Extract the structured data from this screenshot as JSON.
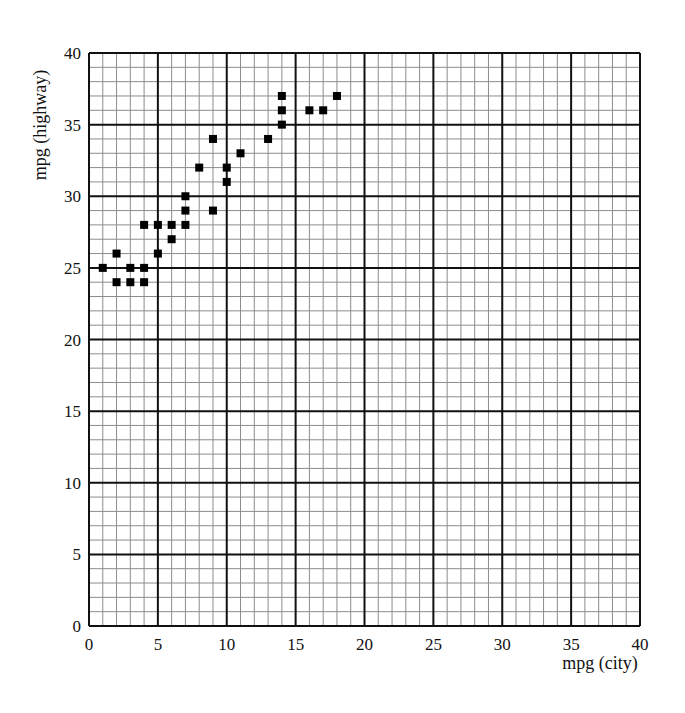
{
  "chart_data": {
    "type": "scatter",
    "title": "",
    "xlabel": "mpg (city)",
    "ylabel": "mpg (highway)",
    "xlim": [
      0,
      40
    ],
    "ylim": [
      0,
      40
    ],
    "xticks": [
      0,
      5,
      10,
      15,
      20,
      25,
      30,
      35,
      40
    ],
    "yticks": [
      0,
      5,
      10,
      15,
      20,
      25,
      30,
      35,
      40
    ],
    "grid": {
      "minor_step": 1,
      "major_step": 5,
      "on": true
    },
    "legend": null,
    "marker": "square",
    "points": [
      {
        "x": 1,
        "y": 25
      },
      {
        "x": 2,
        "y": 26
      },
      {
        "x": 2,
        "y": 24
      },
      {
        "x": 3,
        "y": 25
      },
      {
        "x": 3,
        "y": 24
      },
      {
        "x": 4,
        "y": 25
      },
      {
        "x": 4,
        "y": 24
      },
      {
        "x": 4,
        "y": 28
      },
      {
        "x": 5,
        "y": 28
      },
      {
        "x": 5,
        "y": 26
      },
      {
        "x": 6,
        "y": 28
      },
      {
        "x": 6,
        "y": 27
      },
      {
        "x": 7,
        "y": 30
      },
      {
        "x": 7,
        "y": 29
      },
      {
        "x": 7,
        "y": 28
      },
      {
        "x": 8,
        "y": 32
      },
      {
        "x": 9,
        "y": 34
      },
      {
        "x": 9,
        "y": 29
      },
      {
        "x": 10,
        "y": 32
      },
      {
        "x": 10,
        "y": 31
      },
      {
        "x": 11,
        "y": 33
      },
      {
        "x": 13,
        "y": 34
      },
      {
        "x": 14,
        "y": 37
      },
      {
        "x": 14,
        "y": 36
      },
      {
        "x": 14,
        "y": 35
      },
      {
        "x": 16,
        "y": 36
      },
      {
        "x": 17,
        "y": 36
      },
      {
        "x": 18,
        "y": 37
      }
    ]
  },
  "style": {
    "minor_grid_color": "#8c8c8c",
    "major_grid_color": "#111111",
    "marker_color": "#000000"
  }
}
